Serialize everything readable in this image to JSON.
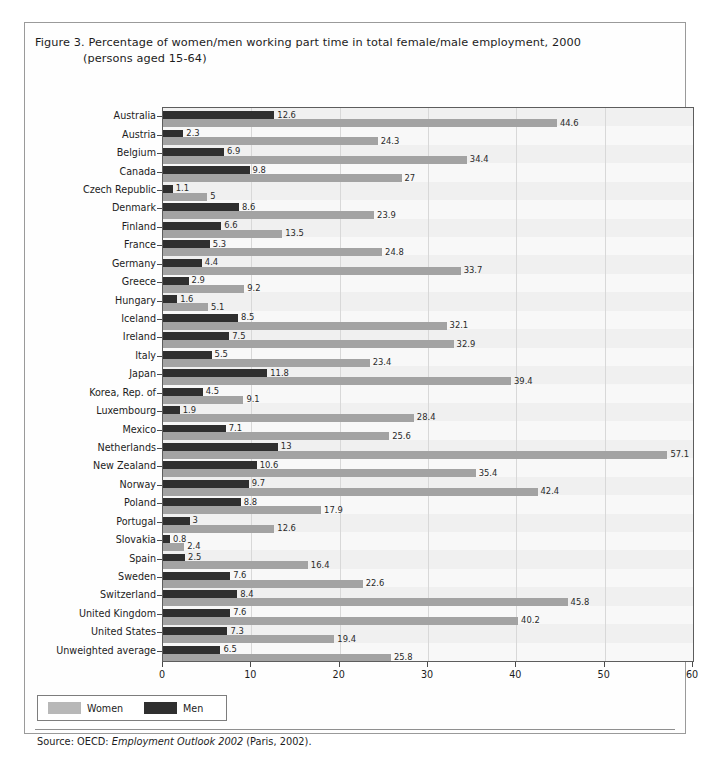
{
  "figure": {
    "title_line1": "Figure 3.  Percentage of women/men working part time in total female/male employment, 2000",
    "title_line2": "(persons aged 15-64)",
    "source_prefix": "Source: OECD: ",
    "source_italic": "Employment Outlook 2002",
    "source_suffix": " (Paris, 2002)."
  },
  "legend": {
    "women_label": "Women",
    "men_label": "Men",
    "women_color": "#b8b8b8",
    "men_color": "#2f2f2f"
  },
  "chart_data": {
    "type": "bar",
    "orientation": "horizontal",
    "title": "Figure 3.  Percentage of women/men working part time in total female/male employment, 2000 (persons aged 15-64)",
    "xlabel": "",
    "ylabel": "",
    "xlim": [
      0,
      60
    ],
    "xticks": [
      0,
      10,
      20,
      30,
      40,
      50,
      60
    ],
    "grid": true,
    "legend_position": "below-left",
    "categories": [
      "Australia",
      "Austria",
      "Belgium",
      "Canada",
      "Czech Republic",
      "Denmark",
      "Finland",
      "France",
      "Germany",
      "Greece",
      "Hungary",
      "Iceland",
      "Ireland",
      "Italy",
      "Japan",
      "Korea, Rep. of",
      "Luxembourg",
      "Mexico",
      "Netherlands",
      "New Zealand",
      "Norway",
      "Poland",
      "Portugal",
      "Slovakia",
      "Spain",
      "Sweden",
      "Switzerland",
      "United Kingdom",
      "United States",
      "Unweighted average"
    ],
    "series": [
      {
        "name": "Men",
        "color": "#2f2f2f",
        "values": [
          12.6,
          2.3,
          6.9,
          9.8,
          1.1,
          8.6,
          6.6,
          5.3,
          4.4,
          2.9,
          1.6,
          8.5,
          7.5,
          5.5,
          11.8,
          4.5,
          1.9,
          7.1,
          13,
          10.6,
          9.7,
          8.8,
          3,
          0.8,
          2.5,
          7.6,
          8.4,
          7.6,
          7.3,
          6.5
        ],
        "labels": [
          "12.6",
          "2.3",
          "6.9",
          "9.8",
          "1.1",
          "8.6",
          "6.6",
          "5.3",
          "4.4",
          "2.9",
          "1.6",
          "8.5",
          "7.5",
          "5.5",
          "11.8",
          "4.5",
          "1.9",
          "7.1",
          "13",
          "10.6",
          "9.7",
          "8.8",
          "3",
          "0.8",
          "2.5",
          "7.6",
          "8.4",
          "7.6",
          "7.3",
          "6.5"
        ]
      },
      {
        "name": "Women",
        "color": "#a3a3a3",
        "values": [
          44.6,
          24.3,
          34.4,
          27,
          5,
          23.9,
          13.5,
          24.8,
          33.7,
          9.2,
          5.1,
          32.1,
          32.9,
          23.4,
          39.4,
          9.1,
          28.4,
          25.6,
          57.1,
          35.4,
          42.4,
          17.9,
          12.6,
          2.4,
          16.4,
          22.6,
          45.8,
          40.2,
          19.4,
          25.8
        ],
        "labels": [
          "44.6",
          "24.3",
          "34.4",
          "27",
          "5",
          "23.9",
          "13.5",
          "24.8",
          "33.7",
          "9.2",
          "5.1",
          "32.1",
          "32.9",
          "23.4",
          "39.4",
          "9.1",
          "28.4",
          "25.6",
          "57.1",
          "35.4",
          "42.4",
          "17.9",
          "12.6",
          "2.4",
          "16.4",
          "22.6",
          "45.8",
          "40.2",
          "19.4",
          "25.8"
        ]
      }
    ]
  }
}
